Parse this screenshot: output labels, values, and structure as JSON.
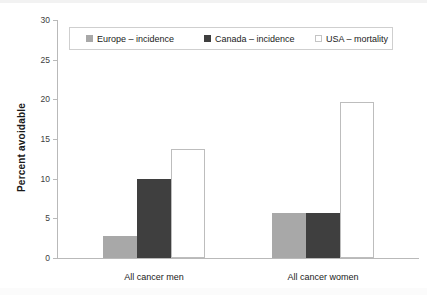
{
  "chart_data": {
    "type": "bar",
    "title": "",
    "xlabel": "",
    "ylabel": "Percent avoidable",
    "ylim": [
      0,
      30
    ],
    "yticks": [
      0,
      5,
      10,
      15,
      20,
      25,
      30
    ],
    "ytick_labels": [
      "0",
      "5",
      "10",
      "15",
      "20",
      "25",
      "30"
    ],
    "grid": false,
    "legend_position": "top-center",
    "categories": [
      "All cancer men",
      "All cancer women"
    ],
    "series": [
      {
        "name": "Europe – incidence",
        "color": "#a8a8a8",
        "values": [
          2.8,
          5.7
        ]
      },
      {
        "name": "Canada – incidence",
        "color": "#3f3f3f",
        "values": [
          10.0,
          5.65
        ]
      },
      {
        "name": "USA – mortality",
        "color": "#ffffff",
        "values": [
          13.8,
          19.7
        ]
      }
    ]
  },
  "axis": {
    "y_title": "Percent avoidable",
    "tick_0": "0",
    "tick_5": "5",
    "tick_10": "10",
    "tick_15": "15",
    "tick_20": "20",
    "tick_25": "25",
    "tick_30": "30"
  },
  "categories": {
    "men": "All cancer men",
    "women": "All cancer women"
  },
  "legend": {
    "europe": "Europe – incidence",
    "canada": "Canada – incidence",
    "usa": "USA – mortality"
  },
  "colors": {
    "europe": "#a8a8a8",
    "canada": "#3f3f3f",
    "usa_fill": "#ffffff",
    "usa_border": "#bdbdbd",
    "axis": "#b9b9b9",
    "text": "#1a1a1a"
  }
}
